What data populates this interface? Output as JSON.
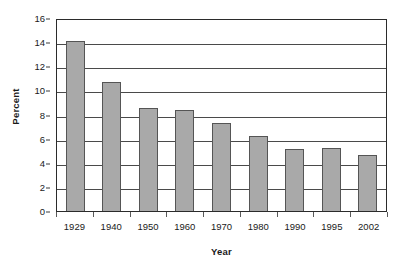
{
  "chart_data": {
    "type": "bar",
    "title": "",
    "subtitle": "",
    "xlabel": "Year",
    "ylabel": "Percent",
    "categories": [
      "1929",
      "1940",
      "1950",
      "1960",
      "1970",
      "1980",
      "1990",
      "1995",
      "2002"
    ],
    "values": [
      14.1,
      10.7,
      8.5,
      8.35,
      7.3,
      6.2,
      5.15,
      5.25,
      4.65
    ],
    "series": [
      {
        "name": "Percent",
        "values": [
          14.1,
          10.7,
          8.5,
          8.35,
          7.3,
          6.2,
          5.15,
          5.25,
          4.65
        ]
      }
    ],
    "ylim": [
      0,
      16
    ],
    "ytick_values": [
      0,
      2,
      4,
      6,
      8,
      10,
      12,
      14,
      16
    ],
    "ytick_labels": [
      "0",
      "2",
      "4",
      "6",
      "8",
      "10",
      "12",
      "14",
      "16"
    ],
    "grid": true,
    "grid_axis": "y",
    "legend": false,
    "legend_position": "none",
    "annotations": [],
    "colors": {
      "bar_fill": "#a9a9a9",
      "bar_border": "#555555",
      "gridline": "#4a4a4a",
      "axis": "#2b2b2b",
      "background": "#ffffff",
      "text": "#1a1a1a"
    }
  }
}
